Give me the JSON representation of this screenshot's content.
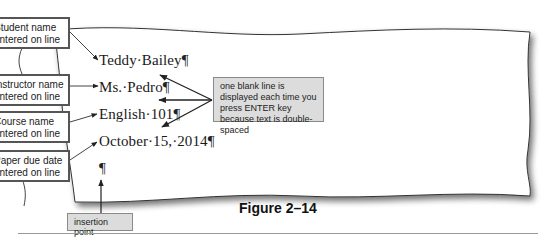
{
  "document": {
    "lines": [
      {
        "text": "Teddy·Bailey",
        "mark": "¶"
      },
      {
        "text": "Ms.·Pedro",
        "mark": "¶"
      },
      {
        "text": "English·101",
        "mark": "¶"
      },
      {
        "text": "October·15,·2014",
        "mark": "¶"
      }
    ],
    "empty_paragraph_mark": "¶"
  },
  "callouts": [
    {
      "line1": "Student name",
      "line2": "entered on line 1"
    },
    {
      "line1": "Instructor name",
      "line2": "entered on line 2"
    },
    {
      "line1": "Course name",
      "line2": "entered on line 3"
    },
    {
      "line1": "Paper due date",
      "line2": "entered on line 4"
    }
  ],
  "note": {
    "text": "one blank line is displayed each time you press ENTER key because text is double-spaced"
  },
  "insertion_point_label": "insertion point",
  "figure_caption": "Figure 2–14",
  "colors": {
    "callout_border": "#555555",
    "note_fill": "#dcdcdc",
    "arrow": "#222222"
  }
}
